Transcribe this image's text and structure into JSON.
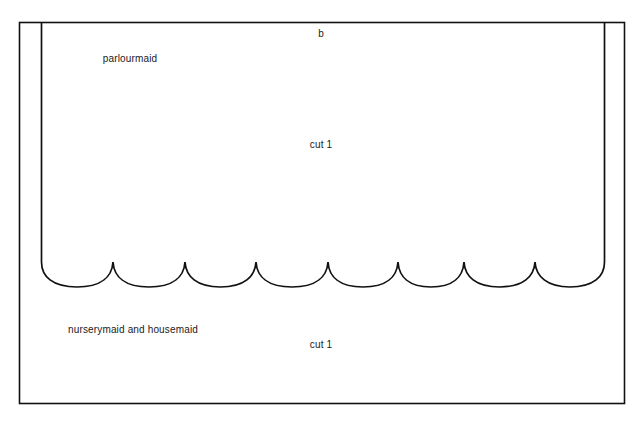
{
  "diagram": {
    "type": "sewing-pattern-piece",
    "background_color": "#ffffff",
    "line_color": "#111111",
    "text_color": "#1a1a1a",
    "piece_letter": "b",
    "labels": {
      "piece_letter": "b",
      "upper_piece_name": "parlourmaid",
      "upper_cut_instruction": "cut 1",
      "lower_piece_name": "nurserymaid and housemaid",
      "lower_cut_instruction": "cut 1"
    },
    "geometry": {
      "outer_border": {
        "x": 19,
        "y": 22,
        "width": 606,
        "height": 382
      },
      "inner_left_line_x": 41,
      "inner_right_line_x": 605,
      "inner_line_top_y": 22,
      "scallop_count": 8,
      "scallop_start_x": 41,
      "scallop_end_x": 605,
      "scallop_cusp_y": 262,
      "scallop_bottom_y": 287,
      "scallop_cusps_x": [
        113,
        185,
        256,
        328,
        398,
        464,
        535
      ],
      "stroke_width": 1.6
    }
  }
}
